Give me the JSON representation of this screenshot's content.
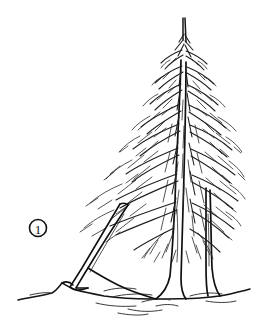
{
  "figure": {
    "kind": "line-drawing",
    "background_color": "#ffffff",
    "ink_color": "#1a1a1a",
    "width": 260,
    "height": 328
  },
  "callout": {
    "label": "1",
    "shape": "circle",
    "center_x": 38,
    "center_y": 228,
    "radius": 8.5,
    "text_color": "#111111",
    "circle_color": "#111111"
  },
  "tree": {
    "name": "spruce",
    "crown_top_x": 183,
    "crown_top_y": 18,
    "crown_left_x": 72,
    "crown_right_x": 242,
    "crown_bottom_y": 238,
    "trunk_base_x": 172,
    "trunk_base_y": 300,
    "secondary_trunk_base_x": 207,
    "branch_style": "drooping-pendulous",
    "stroke_color": "#1f1f1f"
  },
  "prop_pole": {
    "name": "leaning-prop-pole",
    "top_x": 128,
    "top_y": 205,
    "bottom_x": 74,
    "bottom_y": 288,
    "stroke_color": "#101010"
  },
  "ground": {
    "name": "ground-line",
    "left_x": 18,
    "right_x": 250,
    "baseline_y": 299,
    "mound_x": 62,
    "mound_y": 282,
    "stroke_color": "#141414"
  }
}
